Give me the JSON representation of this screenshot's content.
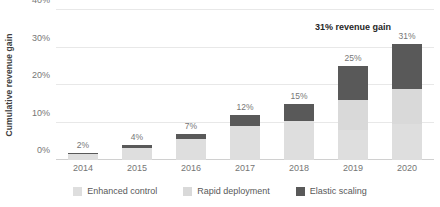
{
  "chart_data": {
    "type": "bar",
    "subtype": "stacked-column",
    "title": "",
    "xlabel": "",
    "ylabel": "Cumulative revenue gain",
    "ylim": [
      0,
      40
    ],
    "ytick_labels": [
      "0%",
      "10%",
      "20%",
      "30%",
      "40%"
    ],
    "ytick_values": [
      0,
      10,
      20,
      30,
      40
    ],
    "grid": true,
    "legend_position": "bottom",
    "categories": [
      "2014",
      "2015",
      "2016",
      "2017",
      "2018",
      "2019",
      "2020"
    ],
    "series": [
      {
        "name": "Enhanced control",
        "color": "#dedede",
        "values": [
          1.6,
          3.2,
          5.6,
          9.0,
          10.5,
          8.0,
          9.5
        ]
      },
      {
        "name": "Rapid deployment",
        "color": "#d9d9d9",
        "values": [
          0.0,
          0.0,
          0.0,
          0.0,
          0.0,
          8.0,
          9.5
        ]
      },
      {
        "name": "Elastic scaling",
        "color": "#595959",
        "values": [
          0.4,
          0.8,
          1.4,
          3.0,
          4.5,
          9.0,
          12.0
        ]
      }
    ],
    "totals": [
      2,
      4,
      7,
      12,
      15,
      25,
      31
    ],
    "data_labels": [
      "2%",
      "4%",
      "7%",
      "12%",
      "15%",
      "25%",
      "31%"
    ],
    "annotations": [
      {
        "text": "31% revenue gain",
        "anchor_category": "2019"
      }
    ]
  },
  "legend": {
    "items": [
      {
        "label": "Enhanced control",
        "color": "#dedede"
      },
      {
        "label": "Rapid deployment",
        "color": "#d9d9d9"
      },
      {
        "label": "Elastic scaling",
        "color": "#595959"
      }
    ]
  }
}
